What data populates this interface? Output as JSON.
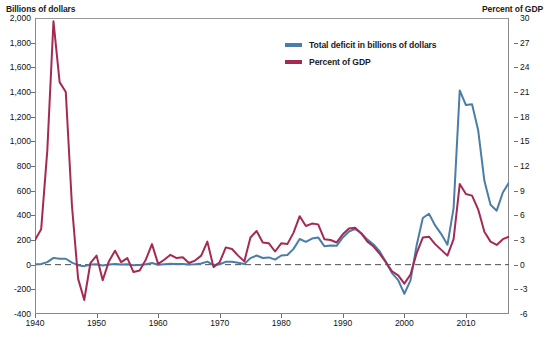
{
  "axis_titles": {
    "left": "Billions of dollars",
    "right": "Percent of GDP"
  },
  "legend": {
    "items": [
      {
        "label": "Total deficit in billions of dollars",
        "color": "#4a7da8",
        "icon": "line-swatch-icon"
      },
      {
        "label": "Percent of GDP",
        "color": "#a52a53",
        "icon": "line-swatch-icon"
      }
    ]
  },
  "chart_data": {
    "type": "line",
    "title": "",
    "subtitle": "",
    "xlabel": "",
    "ylabel": "Billions of dollars",
    "y2label": "Percent of GDP",
    "grid": false,
    "legend_position": "top-center",
    "xlim": [
      1940,
      2017
    ],
    "ylim": [
      -400,
      2000
    ],
    "y2lim": [
      -6,
      30
    ],
    "xticks": [
      1940,
      1950,
      1960,
      1970,
      1980,
      1990,
      2000,
      2010
    ],
    "yticks": [
      -400,
      -200,
      0,
      200,
      400,
      600,
      800,
      1000,
      1200,
      1400,
      1600,
      1800,
      2000
    ],
    "ytick_labels": [
      "-400",
      "-200",
      "0",
      "200",
      "400",
      "600",
      "800",
      "1,000",
      "1,200",
      "1,400",
      "1,600",
      "1,800",
      "2,000"
    ],
    "y2ticks": [
      -6,
      -3,
      0,
      3,
      6,
      9,
      12,
      15,
      18,
      21,
      24,
      27,
      30
    ],
    "y2tick_labels": [
      "-6",
      "-3",
      "0",
      "3",
      "6",
      "9",
      "12",
      "15",
      "18",
      "21",
      "24",
      "27",
      "30"
    ],
    "zero_line": 0,
    "zero_line_style": "dashed",
    "x": [
      1940,
      1941,
      1942,
      1943,
      1944,
      1945,
      1946,
      1947,
      1948,
      1949,
      1950,
      1951,
      1952,
      1953,
      1954,
      1955,
      1956,
      1957,
      1958,
      1959,
      1960,
      1961,
      1962,
      1963,
      1964,
      1965,
      1966,
      1967,
      1968,
      1969,
      1970,
      1971,
      1972,
      1973,
      1974,
      1975,
      1976,
      1977,
      1978,
      1979,
      1980,
      1981,
      1982,
      1983,
      1984,
      1985,
      1986,
      1987,
      1988,
      1989,
      1990,
      1991,
      1992,
      1993,
      1994,
      1995,
      1996,
      1997,
      1998,
      1999,
      2000,
      2001,
      2002,
      2003,
      2004,
      2005,
      2006,
      2007,
      2008,
      2009,
      2010,
      2011,
      2012,
      2013,
      2014,
      2015,
      2016,
      2017
    ],
    "series": [
      {
        "name": "Total deficit in billions of dollars",
        "axis": "left",
        "color": "#4a7da8",
        "values": [
          3,
          5,
          21,
          55,
          48,
          48,
          16,
          -4,
          -12,
          1,
          3,
          -6,
          2,
          6,
          1,
          3,
          -4,
          -3,
          3,
          13,
          0,
          3,
          7,
          5,
          6,
          1,
          4,
          9,
          25,
          -3,
          3,
          23,
          23,
          15,
          6,
          53,
          74,
          54,
          59,
          41,
          74,
          79,
          128,
          208,
          185,
          212,
          221,
          150,
          155,
          153,
          221,
          269,
          290,
          255,
          203,
          164,
          107,
          22,
          -69,
          -126,
          -236,
          -128,
          158,
          378,
          413,
          318,
          248,
          161,
          459,
          1413,
          1294,
          1300,
          1087,
          680,
          485,
          438,
          585,
          665
        ]
      },
      {
        "name": "Percent of GDP",
        "axis": "right",
        "color": "#a52a53",
        "values": [
          3.0,
          4.3,
          13.9,
          29.6,
          22.2,
          21.0,
          7.2,
          -1.7,
          -4.3,
          0.2,
          1.1,
          -1.9,
          0.4,
          1.7,
          0.3,
          0.8,
          -0.9,
          -0.7,
          0.6,
          2.5,
          0.1,
          0.6,
          1.2,
          0.8,
          0.9,
          0.2,
          0.5,
          1.1,
          2.8,
          -0.3,
          0.3,
          2.1,
          1.9,
          1.1,
          0.4,
          3.3,
          4.1,
          2.7,
          2.6,
          1.6,
          2.6,
          2.5,
          3.9,
          5.9,
          4.7,
          5.0,
          4.9,
          3.1,
          3.0,
          2.7,
          3.7,
          4.4,
          4.5,
          3.8,
          2.8,
          2.2,
          1.3,
          0.3,
          -0.8,
          -1.3,
          -2.3,
          -1.2,
          1.4,
          3.3,
          3.4,
          2.5,
          1.8,
          1.1,
          3.1,
          9.8,
          8.6,
          8.4,
          6.7,
          4.0,
          2.8,
          2.4,
          3.1,
          3.4
        ]
      }
    ]
  }
}
